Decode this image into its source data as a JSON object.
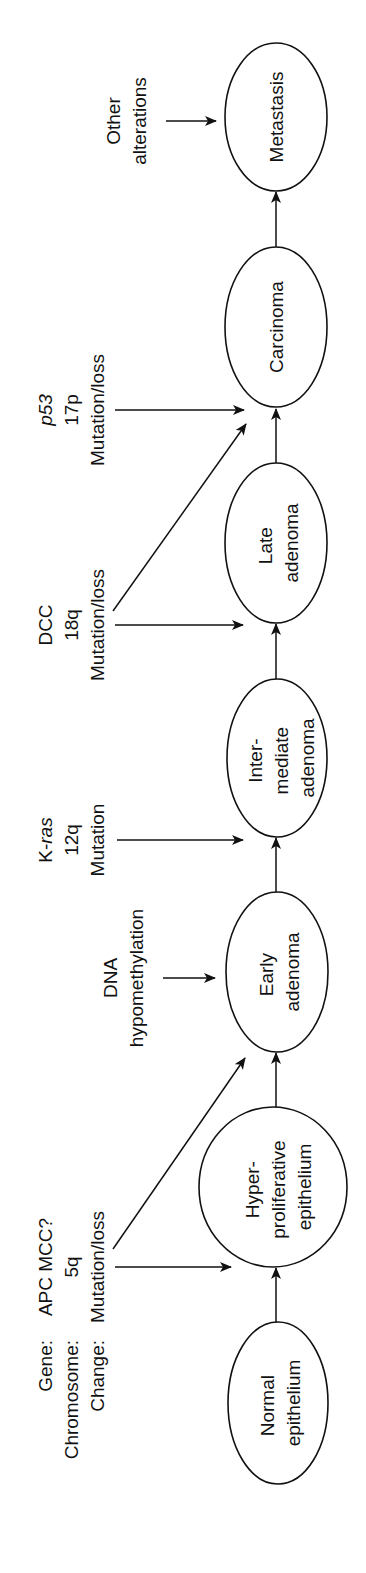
{
  "row_headers": {
    "gene": "Gene:",
    "chromosome": "Chromosome:",
    "change": "Change:"
  },
  "stages": [
    {
      "id": "normal",
      "lines": [
        "Normal",
        "epithelium"
      ]
    },
    {
      "id": "hyperproliferative",
      "lines": [
        "Hyper-",
        "proliferative",
        "epithelium"
      ]
    },
    {
      "id": "early",
      "lines": [
        "Early",
        "adenoma"
      ]
    },
    {
      "id": "intermediate",
      "lines": [
        "Inter-",
        "mediate",
        "adenoma"
      ]
    },
    {
      "id": "late",
      "lines": [
        "Late",
        "adenoma"
      ]
    },
    {
      "id": "carcinoma",
      "lines": [
        "Carcinoma"
      ]
    },
    {
      "id": "metastasis",
      "lines": [
        "Metastasis"
      ]
    }
  ],
  "alterations": [
    {
      "id": "apc",
      "gene": "APC MCC?",
      "chromosome": "5q",
      "change": "Mutation/loss",
      "targets": [
        "hyperproliferative",
        "early"
      ]
    },
    {
      "id": "dna",
      "lines": [
        "DNA",
        "hypomethylation"
      ],
      "targets": [
        "early"
      ]
    },
    {
      "id": "kras",
      "gene_prefix": "K-",
      "gene_italic": "ras",
      "chromosome": "12q",
      "change": "Mutation",
      "targets": [
        "intermediate"
      ]
    },
    {
      "id": "dcc",
      "gene": "DCC",
      "chromosome": "18q",
      "change": "Mutation/loss",
      "targets": [
        "late",
        "carcinoma"
      ]
    },
    {
      "id": "p53",
      "gene_italic": "p53",
      "chromosome": "17p",
      "change": "Mutation/loss",
      "targets": [
        "carcinoma"
      ]
    },
    {
      "id": "other",
      "lines": [
        "Other",
        "alterations"
      ],
      "targets": [
        "metastasis"
      ]
    }
  ],
  "colors": {
    "ink": "#111111",
    "background": "#ffffff"
  }
}
